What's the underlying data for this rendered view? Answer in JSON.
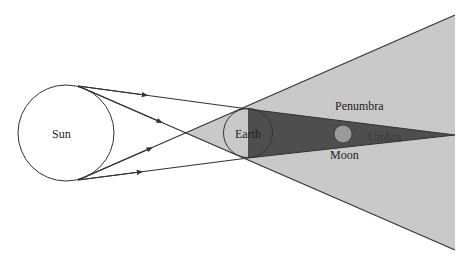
{
  "labels": {
    "sun": "Sun",
    "earth": "Earth",
    "moon": "Moon",
    "penumbra": "Penumbra",
    "umbra": "Umbra"
  },
  "colors": {
    "background": "#ffffff",
    "penumbra_fill": "#c9c9c9",
    "umbra_fill": "#4e4e4e",
    "moon_fill": "#9a9a9a",
    "line": "#333333"
  }
}
